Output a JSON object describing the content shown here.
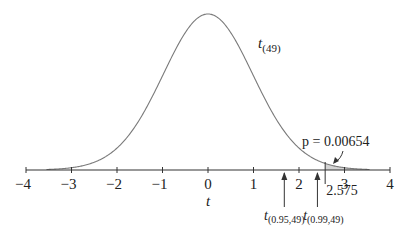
{
  "chart_data": {
    "type": "line",
    "title": "",
    "xlabel": "t",
    "ylabel": "",
    "xlim": [
      -4,
      4
    ],
    "grid": false,
    "x_ticks": [
      -4,
      -3,
      -2,
      -1,
      0,
      1,
      2,
      3,
      4
    ],
    "x_tick_labels": [
      "−4",
      "−3",
      "−2",
      "−1",
      "0",
      "1",
      "2",
      "3",
      "4"
    ],
    "series": [
      {
        "name": "t(49)",
        "distribution": "Student t",
        "df": 49,
        "label_base": "t",
        "label_sub": "(49)",
        "peak_density": 0.397
      }
    ],
    "shaded_region": {
      "from": 2.575,
      "to": 4,
      "area_label": "p = 0.00654",
      "p_value": 0.00654,
      "boundary_label": "2.575",
      "fill": "#d4d4d4"
    },
    "annotations": [
      {
        "x": 1.677,
        "label_base": "t",
        "label_sub": "(0.95,49)"
      },
      {
        "x": 2.405,
        "label_base": "t",
        "label_sub": "(0.99,49)"
      }
    ]
  },
  "colors": {
    "curve": "#7a7a7a",
    "axis": "#333333",
    "text": "#222222"
  },
  "layout": {
    "x0_px": 208,
    "px_per_unit": 45.5,
    "axis_y": 170,
    "peak_px": 156
  }
}
